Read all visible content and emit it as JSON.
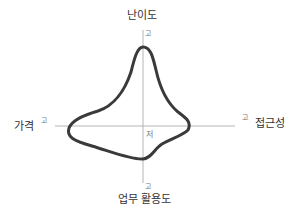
{
  "diagram": {
    "type": "radar-profile",
    "axes": {
      "top": {
        "title": "난이도",
        "tick": "고"
      },
      "left": {
        "title": "가격",
        "tick": "고"
      },
      "right": {
        "title": "접근성",
        "tick": "고"
      },
      "bottom": {
        "title": "업무 활용도",
        "tick": "고"
      }
    },
    "center_label": "저",
    "colors": {
      "axis_line": "#b5b5b5",
      "shape_stroke": "#3a3a3a",
      "text": "#333333",
      "tick_text": "#777777"
    }
  }
}
